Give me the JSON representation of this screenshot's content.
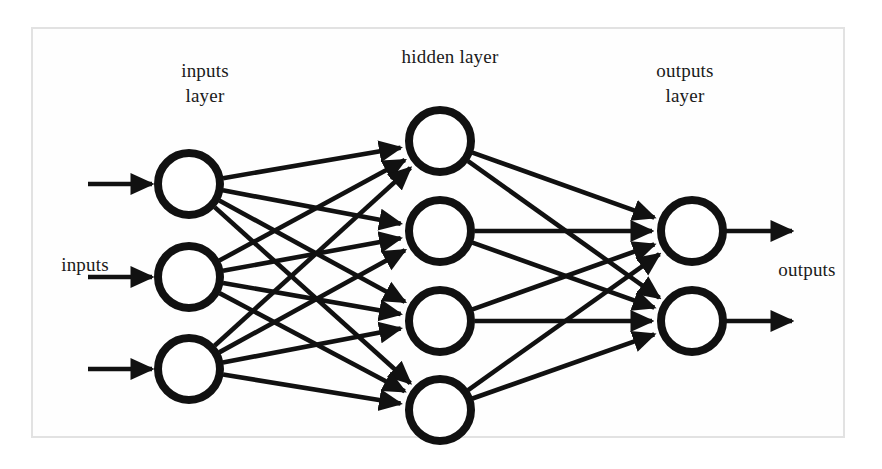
{
  "figure": {
    "type": "neural-network-diagram",
    "title": "",
    "background_color": "#ffffff",
    "frame_color": "#e2e2e2",
    "stroke_color": "#111111",
    "node_fill": "#ffffff",
    "text_color": "#1a1a1a"
  },
  "labels": {
    "inputs_layer_line1": "inputs",
    "inputs_layer_line2": "layer",
    "hidden_layer": "hidden layer",
    "outputs_layer_line1": "outputs",
    "outputs_layer_line2": "layer",
    "inputs_side": "inputs",
    "outputs_side": "outputs"
  },
  "chart_data": {
    "type": "diagram",
    "layers": [
      {
        "name": "inputs layer",
        "label": "inputs layer",
        "node_count": 3,
        "cx": 189,
        "node_y": [
          184,
          277,
          369
        ],
        "radius": 31,
        "stroke_width": 8
      },
      {
        "name": "hidden layer",
        "label": "hidden layer",
        "node_count": 4,
        "cx": 440,
        "node_y": [
          141,
          231,
          321,
          410
        ],
        "radius": 31,
        "stroke_width": 8
      },
      {
        "name": "outputs layer",
        "label": "outputs layer",
        "node_count": 2,
        "cx": 692,
        "node_y": [
          231,
          321
        ],
        "radius": 31,
        "stroke_width": 8
      }
    ],
    "connections": [
      {
        "from_layer": 0,
        "to_layer": 1,
        "pattern": "fully-connected",
        "count": 12,
        "arrowheads": true
      },
      {
        "from_layer": 1,
        "to_layer": 2,
        "pattern": "fully-connected",
        "count": 8,
        "arrowheads": true
      }
    ],
    "input_arrows": {
      "count": 3,
      "x_start": 88,
      "x_end": 152,
      "y": [
        184,
        277,
        369
      ],
      "direction": "right"
    },
    "output_arrows": {
      "count": 2,
      "x_start": 726,
      "x_end": 792,
      "y": [
        231,
        321
      ],
      "direction": "right"
    },
    "frame": {
      "x": 31,
      "y": 27,
      "width": 814,
      "height": 411
    }
  }
}
